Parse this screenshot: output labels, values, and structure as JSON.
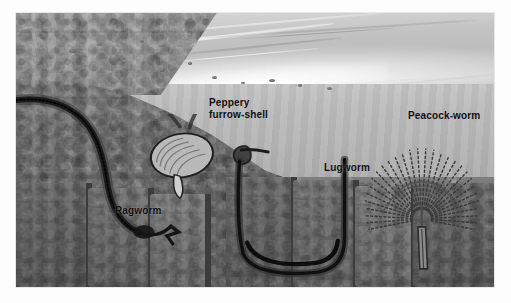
{
  "figure": {
    "medium": "grayscale illustration",
    "border_color": "#ffffff"
  },
  "palette": {
    "sky": "#d0d0d0",
    "foam": "#ffffff",
    "water": "#b5b5b5",
    "sand_upper": "#9a9a9a",
    "sediment_mid": "#7a7a7a",
    "sediment_deep": "#646464",
    "burrow_dark": "#2a2a2a",
    "label_text": "#0e0e0e"
  },
  "labels": [
    {
      "id": "peppery-furrow-shell",
      "text": "Peppery\nfurrow-shell",
      "x": 193,
      "y": 84
    },
    {
      "id": "ragworm",
      "text": "Ragworm",
      "x": 99,
      "y": 192
    },
    {
      "id": "lugworm",
      "text": "Lugworm",
      "x": 308,
      "y": 149
    },
    {
      "id": "peacock-worm",
      "text": "Peacock-worm",
      "x": 392,
      "y": 97
    }
  ],
  "scene": {
    "regions": [
      {
        "name": "sky-and-distant-surf",
        "description": "pale grey sky with breaking waves along the horizon"
      },
      {
        "name": "breaking-foam",
        "description": "white foam of a wave breaking on the shore"
      },
      {
        "name": "water-column",
        "description": "shallow sea water covering the right-hand flat"
      },
      {
        "name": "exposed-sand-bank",
        "description": "sloping sand bank at upper left, above the waterline"
      },
      {
        "name": "sediment-cross-section",
        "description": "cut-away mud and sand in which the animals burrow"
      },
      {
        "name": "rubble-blocks",
        "description": "blocky sediment masses along the lower flat"
      }
    ],
    "animals": [
      {
        "name": "Ragworm",
        "position": "left",
        "description": "dark segmented worm lying in a long curved burrow through the sand bank"
      },
      {
        "name": "Peppery furrow-shell",
        "position": "centre-left",
        "description": "bivalve shell buried in sediment with long siphons reaching the surface"
      },
      {
        "name": "Lugworm",
        "position": "centre-right",
        "description": "worm in a U-shaped burrow with a cast at the head shaft"
      },
      {
        "name": "Peacock-worm",
        "position": "right",
        "description": "tube worm with a radiating fan of feeding tentacles above its vertical tube"
      }
    ]
  }
}
